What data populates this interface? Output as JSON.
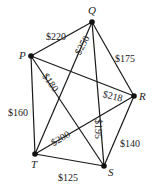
{
  "diagram": {
    "type": "weighted-complete-graph",
    "width": 152,
    "height": 186,
    "colors": {
      "line": "#1a1a1a",
      "text": "#222222",
      "vertex": "#111111"
    },
    "vertices": [
      {
        "id": "Q",
        "label": "Q",
        "x": 92,
        "y": 22,
        "lx": 88,
        "ly": 14
      },
      {
        "id": "P",
        "label": "P",
        "x": 31,
        "y": 56,
        "lx": 19,
        "ly": 59
      },
      {
        "id": "R",
        "label": "R",
        "x": 134,
        "y": 96,
        "lx": 139,
        "ly": 100
      },
      {
        "id": "T",
        "label": "T",
        "x": 35,
        "y": 154,
        "lx": 31,
        "ly": 168
      },
      {
        "id": "S",
        "label": "S",
        "x": 104,
        "y": 166,
        "lx": 108,
        "ly": 176
      }
    ],
    "edges": [
      {
        "from": "P",
        "to": "Q",
        "weight": "$220",
        "lx": 46,
        "ly": 33,
        "rot": 0
      },
      {
        "from": "Q",
        "to": "T",
        "weight": "$250",
        "lx": 74,
        "ly": 52,
        "rot": -62
      },
      {
        "from": "Q",
        "to": "R",
        "weight": "$175",
        "lx": 115,
        "ly": 55,
        "rot": 0
      },
      {
        "from": "Q",
        "to": "S",
        "weight": "$195",
        "lx": 102,
        "ly": 119,
        "rot": 90
      },
      {
        "from": "P",
        "to": "R",
        "weight": "$218",
        "lx": 104,
        "ly": 90,
        "rot": 14
      },
      {
        "from": "P",
        "to": "S",
        "weight": "$180",
        "lx": 48,
        "ly": 72,
        "rot": 55
      },
      {
        "from": "P",
        "to": "T",
        "weight": "$160",
        "lx": 8,
        "ly": 109,
        "rot": 0
      },
      {
        "from": "T",
        "to": "R",
        "weight": "$200",
        "lx": 50,
        "ly": 140,
        "rot": -30
      },
      {
        "from": "R",
        "to": "S",
        "weight": "$140",
        "lx": 120,
        "ly": 140,
        "rot": 0
      },
      {
        "from": "T",
        "to": "S",
        "weight": "$125",
        "lx": 58,
        "ly": 174,
        "rot": 0
      }
    ]
  }
}
